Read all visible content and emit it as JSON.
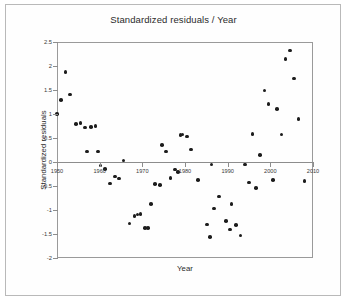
{
  "chart_data": {
    "type": "scatter",
    "title": "Standardized residuals / Year",
    "xlabel": "Year",
    "ylabel": "Standardized residuals",
    "xlim": [
      1950,
      2010
    ],
    "ylim": [
      -2,
      2.5
    ],
    "xticks": [
      1950,
      1960,
      1970,
      1980,
      1990,
      2000,
      2010
    ],
    "xtick_labels": [
      "1950",
      "1960",
      "1970",
      "1980",
      "1990",
      "2000",
      "2010"
    ],
    "yticks": [
      2.5,
      2,
      1.5,
      1,
      0.5,
      0,
      -0.5,
      -1,
      -1.5,
      -2
    ],
    "ytick_labels": [
      "2.5",
      "2",
      "1.5",
      "1",
      "0.5",
      "0",
      "-0.5",
      "-1",
      "-1.5",
      "-2"
    ],
    "grid": false,
    "legend": "none",
    "marker": "filled-circle",
    "marker_color": "#1c1c1c",
    "axis_color": "#8d8d8d",
    "zero_line": 0,
    "series": [
      {
        "name": "Standardized residuals",
        "points": [
          [
            1950.0,
            1.0
          ],
          [
            1951.0,
            1.29
          ],
          [
            1952.0,
            1.88
          ],
          [
            1953.0,
            1.41
          ],
          [
            1954.5,
            0.79
          ],
          [
            1955.5,
            0.81
          ],
          [
            1956.5,
            0.72
          ],
          [
            1957.0,
            0.22
          ],
          [
            1958.0,
            0.73
          ],
          [
            1959.0,
            0.75
          ],
          [
            1959.6,
            0.22
          ],
          [
            1960.2,
            -0.07
          ],
          [
            1961.3,
            -0.14
          ],
          [
            1962.4,
            -0.45
          ],
          [
            1963.6,
            -0.3
          ],
          [
            1964.6,
            -0.34
          ],
          [
            1965.6,
            0.03
          ],
          [
            1967.0,
            -1.28
          ],
          [
            1968.2,
            -1.13
          ],
          [
            1968.9,
            -1.09
          ],
          [
            1969.6,
            -1.08
          ],
          [
            1970.6,
            -1.38
          ],
          [
            1971.3,
            -1.38
          ],
          [
            1972.0,
            -0.88
          ],
          [
            1973.0,
            -0.46
          ],
          [
            1974.2,
            -0.48
          ],
          [
            1974.6,
            0.36
          ],
          [
            1975.6,
            0.22
          ],
          [
            1976.6,
            -0.33
          ],
          [
            1977.6,
            -0.16
          ],
          [
            1978.3,
            -0.21
          ],
          [
            1978.9,
            0.56
          ],
          [
            1979.4,
            0.57
          ],
          [
            1980.4,
            0.53
          ],
          [
            1981.4,
            0.26
          ],
          [
            1983.0,
            -0.38
          ],
          [
            1985.2,
            -1.3
          ],
          [
            1985.8,
            -1.56
          ],
          [
            1986.2,
            -0.05
          ],
          [
            1986.8,
            -0.97
          ],
          [
            1988.0,
            -0.72
          ],
          [
            1989.6,
            -1.23
          ],
          [
            1990.6,
            -1.41
          ],
          [
            1990.9,
            -0.88
          ],
          [
            1992.0,
            -1.31
          ],
          [
            1993.0,
            -1.53
          ],
          [
            1994.0,
            -0.05
          ],
          [
            1995.0,
            -0.43
          ],
          [
            1995.8,
            0.58
          ],
          [
            1996.6,
            -0.54
          ],
          [
            1997.6,
            0.15
          ],
          [
            1998.6,
            1.49
          ],
          [
            1999.6,
            1.21
          ],
          [
            2000.6,
            -0.37
          ],
          [
            2001.6,
            1.1
          ],
          [
            2002.6,
            0.57
          ],
          [
            2003.6,
            2.15
          ],
          [
            2004.6,
            2.32
          ],
          [
            2005.6,
            1.74
          ],
          [
            2006.6,
            0.89
          ],
          [
            2008.0,
            -0.4
          ]
        ]
      }
    ]
  }
}
